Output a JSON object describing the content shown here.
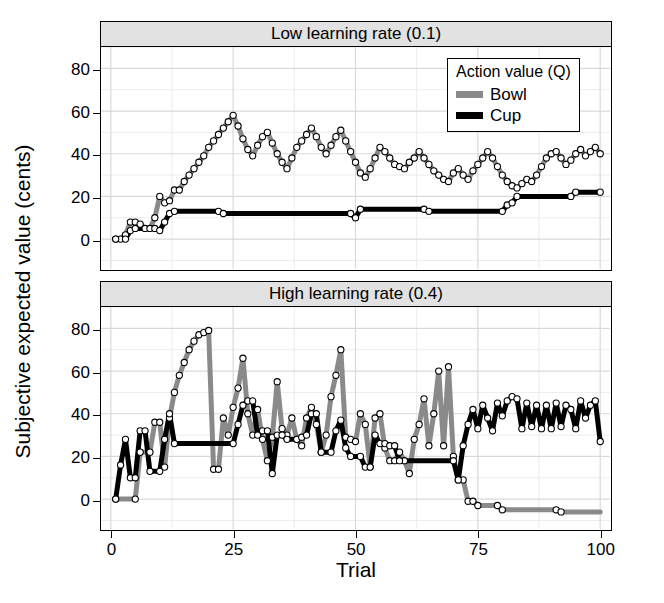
{
  "figure": {
    "ylabel": "Subjective expected value (cents)",
    "xlabel": "Trial",
    "colors": {
      "bowl": "#8a8a8a",
      "cup": "#000000",
      "strip": "#e2e2e2",
      "grid_major": "#d9d9d9",
      "grid_minor": "#ececec",
      "frame": "#000000"
    }
  },
  "legend": {
    "title": "Action value (Q)",
    "items": [
      {
        "label": "Bowl",
        "color": "#8a8a8a"
      },
      {
        "label": "Cup",
        "color": "#000000"
      }
    ]
  },
  "chart_data": [
    {
      "type": "line",
      "title": "Low learning rate (0.1)",
      "xlabel": "Trial",
      "ylabel": "Subjective expected value (cents)",
      "xlim": [
        -2,
        102
      ],
      "ylim": [
        -14,
        90
      ],
      "xticks": [
        0,
        25,
        50,
        75,
        100
      ],
      "yticks": [
        0,
        20,
        40,
        60,
        80
      ],
      "grid": true,
      "markers": "open-circle",
      "legend_position": "top-right",
      "x": [
        1,
        2,
        3,
        4,
        5,
        6,
        7,
        8,
        9,
        10,
        11,
        12,
        13,
        14,
        15,
        16,
        17,
        18,
        19,
        20,
        21,
        22,
        23,
        24,
        25,
        26,
        27,
        28,
        29,
        30,
        31,
        32,
        33,
        34,
        35,
        36,
        37,
        38,
        39,
        40,
        41,
        42,
        43,
        44,
        45,
        46,
        47,
        48,
        49,
        50,
        51,
        52,
        53,
        54,
        55,
        56,
        57,
        58,
        59,
        60,
        61,
        62,
        63,
        64,
        65,
        66,
        67,
        68,
        69,
        70,
        71,
        72,
        73,
        74,
        75,
        76,
        77,
        78,
        79,
        80,
        81,
        82,
        83,
        84,
        85,
        86,
        87,
        88,
        89,
        90,
        91,
        92,
        93,
        94,
        95,
        96,
        97,
        98,
        99,
        100
      ],
      "series": [
        {
          "name": "Bowl",
          "color": "#8a8a8a",
          "values": [
            0,
            0,
            2,
            8,
            8,
            7,
            5,
            5,
            10,
            20,
            17,
            18,
            23,
            23,
            27,
            30,
            33,
            36,
            39,
            43,
            46,
            49,
            52,
            55,
            58,
            53,
            47,
            42,
            39,
            44,
            48,
            50,
            45,
            40,
            36,
            33,
            38,
            43,
            46,
            49,
            52,
            48,
            43,
            40,
            44,
            48,
            51,
            46,
            41,
            36,
            31,
            29,
            33,
            38,
            43,
            41,
            38,
            35,
            34,
            33,
            36,
            38,
            41,
            38,
            35,
            32,
            30,
            28,
            27,
            31,
            33,
            30,
            28,
            32,
            35,
            38,
            41,
            38,
            34,
            30,
            27,
            25,
            24,
            26,
            28,
            27,
            30,
            34,
            38,
            40,
            41,
            38,
            35,
            37,
            40,
            42,
            39,
            41,
            43,
            40
          ]
        },
        {
          "name": "Cup",
          "color": "#000000",
          "values": [
            0,
            0,
            0,
            4,
            5,
            5,
            5,
            5,
            5,
            4,
            8,
            12,
            13,
            13,
            13,
            13,
            13,
            13,
            13,
            13,
            13,
            13,
            12,
            12,
            12,
            12,
            12,
            12,
            12,
            12,
            12,
            12,
            12,
            12,
            12,
            12,
            12,
            12,
            12,
            12,
            12,
            12,
            12,
            12,
            12,
            12,
            12,
            12,
            12,
            10,
            14,
            14,
            14,
            14,
            14,
            14,
            14,
            14,
            14,
            14,
            14,
            14,
            14,
            14,
            13,
            13,
            13,
            13,
            13,
            13,
            13,
            13,
            13,
            13,
            13,
            13,
            13,
            13,
            13,
            13,
            16,
            17,
            20,
            20,
            20,
            20,
            20,
            20,
            20,
            20,
            20,
            20,
            20,
            20,
            22,
            22,
            22,
            22,
            22,
            22
          ]
        }
      ]
    },
    {
      "type": "line",
      "title": "High learning rate (0.4)",
      "xlabel": "Trial",
      "ylabel": "Subjective expected value (cents)",
      "xlim": [
        -2,
        102
      ],
      "ylim": [
        -14,
        90
      ],
      "xticks": [
        0,
        25,
        50,
        75,
        100
      ],
      "yticks": [
        0,
        20,
        40,
        60,
        80
      ],
      "grid": true,
      "markers": "open-circle",
      "legend_position": "none",
      "x": [
        1,
        2,
        3,
        4,
        5,
        6,
        7,
        8,
        9,
        10,
        11,
        12,
        13,
        14,
        15,
        16,
        17,
        18,
        19,
        20,
        21,
        22,
        23,
        24,
        25,
        26,
        27,
        28,
        29,
        30,
        31,
        32,
        33,
        34,
        35,
        36,
        37,
        38,
        39,
        40,
        41,
        42,
        43,
        44,
        45,
        46,
        47,
        48,
        49,
        50,
        51,
        52,
        53,
        54,
        55,
        56,
        57,
        58,
        59,
        60,
        61,
        62,
        63,
        64,
        65,
        66,
        67,
        68,
        69,
        70,
        71,
        72,
        73,
        74,
        75,
        76,
        77,
        78,
        79,
        80,
        81,
        82,
        83,
        84,
        85,
        86,
        87,
        88,
        89,
        90,
        91,
        92,
        93,
        94,
        95,
        96,
        97,
        98,
        99,
        100
      ],
      "series": [
        {
          "name": "Bowl",
          "color": "#8a8a8a",
          "values": [
            0,
            0,
            0,
            0,
            0,
            22,
            22,
            22,
            36,
            36,
            15,
            38,
            50,
            58,
            64,
            70,
            74,
            77,
            78,
            79,
            14,
            14,
            38,
            30,
            43,
            52,
            66,
            40,
            30,
            42,
            28,
            18,
            29,
            55,
            33,
            30,
            38,
            28,
            25,
            38,
            43,
            35,
            22,
            30,
            48,
            58,
            70,
            29,
            28,
            27,
            40,
            35,
            15,
            38,
            40,
            24,
            18,
            18,
            22,
            18,
            12,
            28,
            35,
            47,
            25,
            40,
            60,
            25,
            62,
            20,
            9,
            9,
            -1,
            -1,
            -3,
            -3,
            -3,
            -3,
            -3,
            -5,
            -5,
            -5,
            -5,
            -5,
            -5,
            -5,
            -5,
            -5,
            -5,
            -5,
            -5,
            -6,
            -6,
            -6,
            -6,
            -6,
            -6,
            -6,
            -6,
            -6,
            -6
          ]
        },
        {
          "name": "Cup",
          "color": "#000000",
          "values": [
            0,
            16,
            28,
            10,
            10,
            32,
            32,
            13,
            13,
            13,
            28,
            40,
            26,
            26,
            26,
            26,
            26,
            26,
            26,
            26,
            26,
            26,
            26,
            26,
            26,
            35,
            44,
            46,
            46,
            30,
            32,
            32,
            12,
            30,
            30,
            28,
            28,
            28,
            29,
            30,
            40,
            40,
            22,
            22,
            22,
            32,
            37,
            24,
            20,
            20,
            20,
            15,
            15,
            30,
            26,
            26,
            25,
            25,
            18,
            18,
            18,
            18,
            18,
            18,
            18,
            18,
            18,
            18,
            18,
            18,
            9,
            25,
            35,
            42,
            33,
            44,
            38,
            32,
            45,
            39,
            46,
            48,
            47,
            33,
            45,
            34,
            44,
            33,
            44,
            33,
            45,
            34,
            44,
            42,
            33,
            46,
            38,
            44,
            46,
            27
          ]
        }
      ]
    }
  ]
}
